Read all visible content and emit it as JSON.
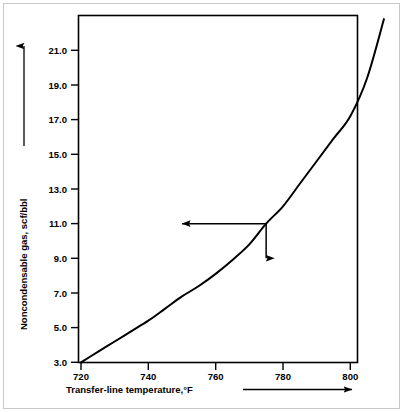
{
  "figure": {
    "background_color": "#ffffff",
    "frame_color": "#c8c8c8",
    "ink_color": "#000000"
  },
  "chart_data": {
    "type": "line",
    "title": "",
    "subtitle": "",
    "xlabel": "Transfer-line temperature,°F",
    "ylabel": "Noncondensable gas, scf/bbl",
    "xlim": [
      720,
      810
    ],
    "ylim": [
      3.0,
      22.8
    ],
    "grid": false,
    "legend": null,
    "legend_position": "none",
    "xticks": [
      720,
      740,
      760,
      780,
      800
    ],
    "xtick_labels": [
      "720",
      "740",
      "760",
      "780",
      "800"
    ],
    "yticks": [
      3.0,
      5.0,
      7.0,
      9.0,
      11.0,
      13.0,
      15.0,
      17.0,
      19.0,
      21.0
    ],
    "ytick_labels": [
      "3.0",
      "5.0",
      "7.0",
      "9.0",
      "11.0",
      "13.0",
      "15.0",
      "17.0",
      "19.0",
      "21.0"
    ],
    "series": [
      {
        "name": "Noncondensable gas yield",
        "x": [
          720,
          725,
          730,
          735,
          740,
          745,
          750,
          755,
          760,
          765,
          770,
          775,
          780,
          785,
          790,
          795,
          800,
          805,
          810
        ],
        "values": [
          3.0,
          3.6,
          4.2,
          4.8,
          5.4,
          6.1,
          6.8,
          7.4,
          8.1,
          8.9,
          9.8,
          11.0,
          12.0,
          13.3,
          14.6,
          15.9,
          17.2,
          19.4,
          22.8
        ]
      }
    ],
    "annotations": [
      {
        "name": "reading-guide",
        "point_x": 775,
        "point_y": 11.0,
        "horizontal_arrow_to_x": 750,
        "vertical_arrow_to_y": 9.0,
        "label": ""
      }
    ],
    "axis_direction_arrows": {
      "y_arrow": "up",
      "x_arrow": "right"
    }
  }
}
